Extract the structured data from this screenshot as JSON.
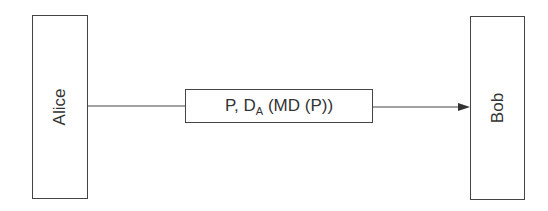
{
  "diagram": {
    "sender": {
      "label": "Alice"
    },
    "receiver": {
      "label": "Bob"
    },
    "message": {
      "prefix": "P, D",
      "subscript": "A",
      "suffix": " (MD (P))"
    },
    "colors": {
      "stroke": "#444444",
      "text": "#333333",
      "background": "#ffffff"
    }
  }
}
